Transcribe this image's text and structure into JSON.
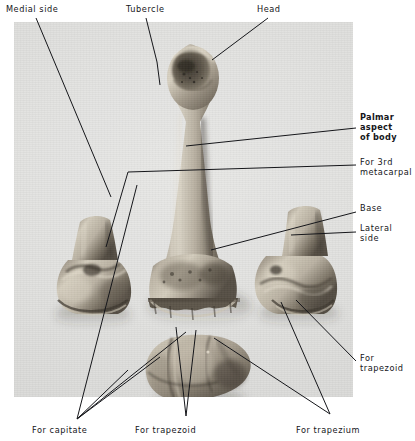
{
  "figure": {
    "plate_background_color": "#e2e2e0",
    "ink_color": "#15161a",
    "page_background_color": "#ffffff"
  },
  "specimens": [
    {
      "name": "left-specimen-base-view",
      "description": "Base of third metacarpal, medial aspect"
    },
    {
      "name": "center-specimen-whole-bone",
      "description": "Third metacarpal bone, palmar aspect, whole"
    },
    {
      "name": "right-specimen-base-view",
      "description": "Base of third metacarpal, lateral aspect"
    },
    {
      "name": "bottom-specimen-articular-surface",
      "description": "Base articular surface, proximal view"
    }
  ],
  "labels": [
    {
      "id": "medial-side",
      "text": "Medial side",
      "bold": false,
      "x": 6,
      "y": 4,
      "align": "left"
    },
    {
      "id": "tubercle",
      "text": "Tubercle",
      "bold": false,
      "x": 126,
      "y": 4,
      "align": "left"
    },
    {
      "id": "head",
      "text": "Head",
      "bold": false,
      "x": 257,
      "y": 4,
      "align": "left"
    },
    {
      "id": "palmar-aspect",
      "text": "Palmar\naspect\nof body",
      "bold": true,
      "x": 360,
      "y": 112,
      "align": "left"
    },
    {
      "id": "for-3rd-metacarpal",
      "text": "For 3rd\nmetacarpal",
      "bold": false,
      "x": 360,
      "y": 157,
      "align": "left"
    },
    {
      "id": "base",
      "text": "Base",
      "bold": false,
      "x": 360,
      "y": 203,
      "align": "left"
    },
    {
      "id": "lateral-side",
      "text": "Lateral\nside",
      "bold": false,
      "x": 360,
      "y": 223,
      "align": "left"
    },
    {
      "id": "for-trapezoid-right",
      "text": "For\ntrapezoid",
      "bold": false,
      "x": 360,
      "y": 353,
      "align": "left"
    },
    {
      "id": "for-capitate",
      "text": "For capitate",
      "bold": false,
      "x": 32,
      "y": 425,
      "align": "left"
    },
    {
      "id": "for-trapezoid-bottom",
      "text": "For trapezoid",
      "bold": false,
      "x": 135,
      "y": 425,
      "align": "left"
    },
    {
      "id": "for-trapezium",
      "text": "For trapezium",
      "bold": false,
      "x": 296,
      "y": 425,
      "align": "left"
    }
  ],
  "leader_lines": [
    {
      "id": "leader-medial-side",
      "points": "36,18 62,80 111,197"
    },
    {
      "id": "leader-tubercle",
      "points": "146,18 157,62 160,85"
    },
    {
      "id": "leader-head",
      "points": "268,18 212,60"
    },
    {
      "id": "leader-palmar-aspect",
      "points": "356,128 186,146"
    },
    {
      "id": "leader-for-3rd-metacarpal",
      "points": "356,165 128,172 106,247"
    },
    {
      "id": "leader-base",
      "points": "356,212 211,250"
    },
    {
      "id": "leader-lateral-side",
      "points": "356,232 291,235"
    },
    {
      "id": "leader-for-trapezoid-right",
      "points": "356,361 296,300"
    },
    {
      "id": "leader-capitate-a",
      "points": "77,419 137,185"
    },
    {
      "id": "leader-capitate-b",
      "points": "77,419 186,332"
    },
    {
      "id": "leader-capitate-c",
      "points": "77,419 160,357"
    },
    {
      "id": "leader-capitate-d",
      "points": "77,419 128,370"
    },
    {
      "id": "leader-trapezoid-a",
      "points": "186,416 176,327"
    },
    {
      "id": "leader-trapezoid-b",
      "points": "186,416 196,330"
    },
    {
      "id": "leader-trapezium-a",
      "points": "330,414 281,302"
    },
    {
      "id": "leader-trapezium-b",
      "points": "330,414 214,338"
    }
  ]
}
